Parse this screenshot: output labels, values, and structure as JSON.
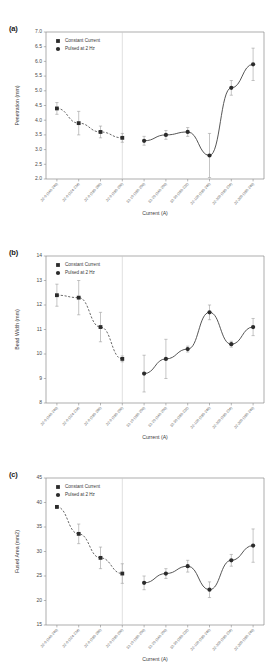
{
  "figure": {
    "background": "#ffffff",
    "marker_color": "#2b2b2b",
    "line_color": "#4d4d4d",
    "error_color": "#9d9d9d",
    "axis_color": "#8a8a8a"
  },
  "legend": {
    "constant_current": "Constant Current",
    "pulsed": "Pulsed at 2 Hz"
  },
  "categories": [
    "32-0 (240-240)",
    "32-0 (224-224)",
    "32-0 (280-280)",
    "32-0 (280-200)",
    "32-10 (280-200)",
    "32-20 (240-200)",
    "32-30 (280-232)",
    "32-100 (280-240)",
    "32-200 (280-224)",
    "32-300 (280-240)"
  ],
  "panels": [
    {
      "tag": "(a)",
      "xlabel": "Current (A)",
      "ylabel": "Penetration (mm)",
      "ylim": [
        2.0,
        7.0
      ],
      "yticks": [
        "2.0",
        "2.5",
        "3.0",
        "3.5",
        "4.0",
        "4.5",
        "5.0",
        "5.5",
        "6.0",
        "6.5",
        "7.0"
      ],
      "divider_index": 3
    },
    {
      "tag": "(b)",
      "xlabel": "Current (A)",
      "ylabel": "Bead Width (mm)",
      "ylim": [
        8,
        14
      ],
      "yticks": [
        "8",
        "9",
        "10",
        "11",
        "12",
        "13",
        "14"
      ],
      "divider_index": 3
    },
    {
      "tag": "(c)",
      "xlabel": "Current (A)",
      "ylabel": "Fused Area (mm2)",
      "ylim": [
        15,
        45
      ],
      "yticks": [
        "15",
        "20",
        "25",
        "30",
        "35",
        "40",
        "45"
      ],
      "divider_index": 3
    }
  ],
  "chart_data": [
    {
      "type": "scatter",
      "title": "(a) Penetration vs Current",
      "xlabel": "Current (A)",
      "ylabel": "Penetration (mm)",
      "ylim": [
        2.0,
        7.0
      ],
      "grid": false,
      "legend_position": "top-left",
      "categories": [
        "32-0 (240-240)",
        "32-0 (224-224)",
        "32-0 (280-280)",
        "32-0 (280-200)",
        "32-10 (280-200)",
        "32-20 (240-200)",
        "32-30 (280-232)",
        "32-100 (280-240)",
        "32-200 (280-224)",
        "32-300 (280-240)"
      ],
      "series": [
        {
          "name": "Constant Current",
          "marker": "square",
          "fit": "dashed",
          "points": [
            {
              "x": 0,
              "y": 4.4,
              "err": 0.2
            },
            {
              "x": 1,
              "y": 3.9,
              "err": 0.4
            },
            {
              "x": 2,
              "y": 3.6,
              "err": 0.2
            },
            {
              "x": 3,
              "y": 3.4,
              "err": 0.15
            }
          ]
        },
        {
          "name": "Pulsed at 2 Hz",
          "marker": "circle",
          "fit": "solid",
          "points": [
            {
              "x": 4,
              "y": 3.3,
              "err": 0.15
            },
            {
              "x": 5,
              "y": 3.5,
              "err": 0.15
            },
            {
              "x": 6,
              "y": 3.6,
              "err": 0.15
            },
            {
              "x": 7,
              "y": 2.8,
              "err": 0.75
            },
            {
              "x": 8,
              "y": 5.1,
              "err": 0.25
            },
            {
              "x": 9,
              "y": 5.9,
              "err": 0.55
            }
          ]
        }
      ]
    },
    {
      "type": "scatter",
      "title": "(b) Bead Width vs Current",
      "xlabel": "Current (A)",
      "ylabel": "Bead Width (mm)",
      "ylim": [
        8,
        14
      ],
      "grid": false,
      "legend_position": "top-left",
      "categories": [
        "32-0 (240-240)",
        "32-0 (224-224)",
        "32-0 (280-280)",
        "32-0 (280-200)",
        "32-10 (280-200)",
        "32-20 (240-200)",
        "32-30 (280-232)",
        "32-100 (280-240)",
        "32-200 (280-224)",
        "32-300 (280-240)"
      ],
      "series": [
        {
          "name": "Constant Current",
          "marker": "square",
          "fit": "dashed",
          "points": [
            {
              "x": 0,
              "y": 12.4,
              "err": 0.45
            },
            {
              "x": 1,
              "y": 12.3,
              "err": 0.7
            },
            {
              "x": 2,
              "y": 11.1,
              "err": 0.6
            },
            {
              "x": 3,
              "y": 9.8,
              "err": 0.12
            }
          ]
        },
        {
          "name": "Pulsed at 2 Hz",
          "marker": "circle",
          "fit": "solid",
          "points": [
            {
              "x": 4,
              "y": 9.2,
              "err": 0.75
            },
            {
              "x": 5,
              "y": 9.8,
              "err": 0.8
            },
            {
              "x": 6,
              "y": 10.2,
              "err": 0.12
            },
            {
              "x": 7,
              "y": 11.7,
              "err": 0.3
            },
            {
              "x": 8,
              "y": 10.4,
              "err": 0.12
            },
            {
              "x": 9,
              "y": 11.1,
              "err": 0.35
            }
          ]
        }
      ]
    },
    {
      "type": "scatter",
      "title": "(c) Fused Area vs Current",
      "xlabel": "Current (A)",
      "ylabel": "Fused Area (mm2)",
      "ylim": [
        15,
        45
      ],
      "grid": false,
      "legend_position": "top-left",
      "categories": [
        "32-0 (240-240)",
        "32-0 (224-224)",
        "32-0 (280-280)",
        "32-0 (280-200)",
        "32-10 (280-200)",
        "32-20 (240-200)",
        "32-30 (280-232)",
        "32-100 (280-240)",
        "32-200 (280-224)",
        "32-300 (280-240)"
      ],
      "series": [
        {
          "name": "Constant Current",
          "marker": "square",
          "fit": "dashed",
          "points": [
            {
              "x": 0,
              "y": 39.1,
              "err": 0.3
            },
            {
              "x": 1,
              "y": 33.6,
              "err": 2.0
            },
            {
              "x": 2,
              "y": 28.7,
              "err": 2.2
            },
            {
              "x": 3,
              "y": 25.5,
              "err": 2.0
            }
          ]
        },
        {
          "name": "Pulsed at 2 Hz",
          "marker": "circle",
          "fit": "solid",
          "points": [
            {
              "x": 4,
              "y": 23.6,
              "err": 1.4
            },
            {
              "x": 5,
              "y": 25.5,
              "err": 1.0
            },
            {
              "x": 6,
              "y": 27.0,
              "err": 1.2
            },
            {
              "x": 7,
              "y": 22.2,
              "err": 1.6
            },
            {
              "x": 8,
              "y": 28.2,
              "err": 1.2
            },
            {
              "x": 9,
              "y": 31.2,
              "err": 3.4
            }
          ]
        }
      ]
    }
  ]
}
